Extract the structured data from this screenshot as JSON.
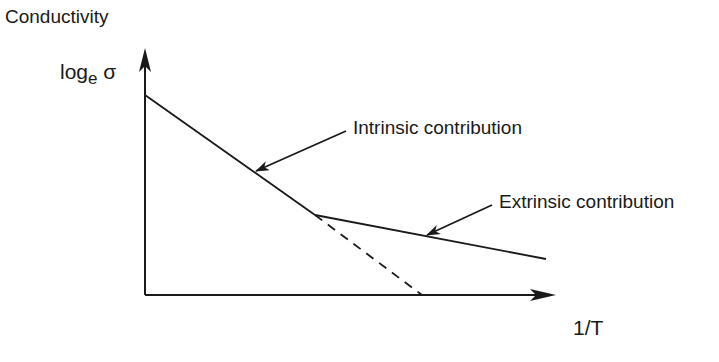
{
  "diagram": {
    "title": "Conductivity",
    "y_axis": {
      "label_main": "log",
      "label_sub": "e",
      "label_symbol": "σ"
    },
    "x_axis": {
      "label": "1/T"
    },
    "annotations": {
      "intrinsic": "Intrinsic contribution",
      "extrinsic": "Extrinsic contribution"
    },
    "colors": {
      "line": "#1a1a1a",
      "background": "#ffffff"
    },
    "geometry": {
      "origin": [
        145,
        295
      ],
      "y_axis_top": [
        145,
        50
      ],
      "x_axis_end": [
        555,
        295
      ],
      "intrinsic_line": [
        [
          145,
          95
        ],
        [
          315,
          215
        ]
      ],
      "extrinsic_line": [
        [
          315,
          215
        ],
        [
          546,
          259
        ]
      ],
      "intrinsic_extrapolation_dashed": [
        [
          315,
          215
        ],
        [
          422,
          295
        ]
      ],
      "intrinsic_pointer": [
        [
          346,
          131
        ],
        [
          256,
          171
        ]
      ],
      "extrinsic_pointer": [
        [
          492,
          205
        ],
        [
          427,
          235
        ]
      ]
    }
  }
}
